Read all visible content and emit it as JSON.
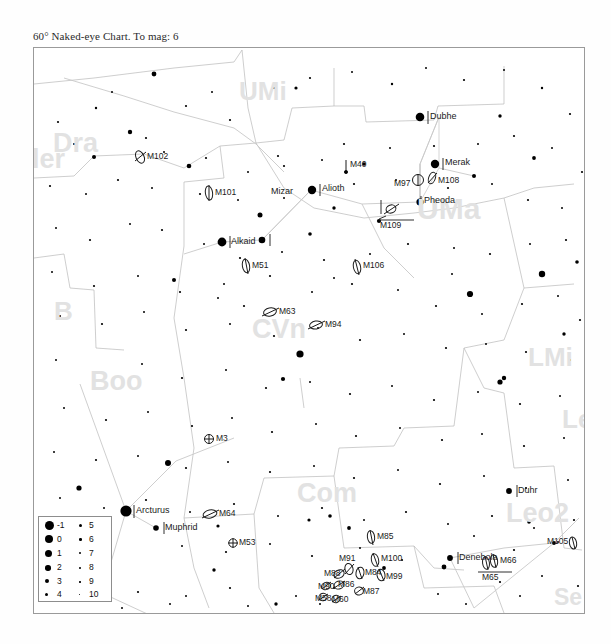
{
  "chart": {
    "title": "60° Naked-eye Chart. To mag: 6",
    "field_of_view_degrees": 60,
    "limiting_magnitude": 6,
    "frame": {
      "x": 33,
      "y": 47,
      "width": 550,
      "height": 565
    }
  },
  "legend": {
    "title": "magnitude-key",
    "rows": [
      {
        "left_mag": "-1",
        "right_mag": "5"
      },
      {
        "left_mag": "0",
        "right_mag": "6"
      },
      {
        "left_mag": "1",
        "right_mag": "7"
      },
      {
        "left_mag": "2",
        "right_mag": "8"
      },
      {
        "left_mag": "3",
        "right_mag": "9"
      },
      {
        "left_mag": "4",
        "right_mag": "10"
      }
    ]
  },
  "constellations": [
    {
      "name": "UMi",
      "x": 205,
      "y": 38,
      "size": 26
    },
    {
      "name": "Dra",
      "x": 152,
      "y": 78,
      "size": 27
    },
    {
      "name": "ler",
      "x": 36,
      "y": 152,
      "size": 27
    },
    {
      "name": "B",
      "x": 62,
      "y": 258,
      "size": 26
    },
    {
      "name": "Boo",
      "x": 90,
      "y": 378,
      "size": 27
    },
    {
      "name": "UMa",
      "x": 410,
      "y": 192,
      "size": 30
    },
    {
      "name": "CVn",
      "x": 255,
      "y": 325,
      "size": 27
    },
    {
      "name": "Com",
      "x": 300,
      "y": 492,
      "size": 27
    },
    {
      "name": "LMi",
      "x": 531,
      "y": 352,
      "size": 26
    },
    {
      "name": "Leo",
      "x": 553,
      "y": 407,
      "size": 26
    },
    {
      "name": "Leo2",
      "x": 520,
      "y": 515,
      "size": 27
    },
    {
      "name": "Se",
      "x": 557,
      "y": 593,
      "size": 23
    }
  ],
  "named_stars": [
    {
      "name": "Dubhe",
      "x": 424,
      "y": 116,
      "mag": 1.8
    },
    {
      "name": "Merak",
      "x": 438,
      "y": 163,
      "mag": 2.4
    },
    {
      "name": "Pheoda",
      "x": 419,
      "y": 201,
      "mag": 2.4
    },
    {
      "name": "Alioth",
      "x": 310,
      "y": 189,
      "mag": 1.8
    },
    {
      "name": "Mizar",
      "x": 261,
      "y": 192,
      "mag": 2.2
    },
    {
      "name": "Alkaid",
      "x": 221,
      "y": 241,
      "mag": 1.9
    },
    {
      "name": "Arcturus",
      "x": 125,
      "y": 510,
      "mag": -0.1
    },
    {
      "name": "Muphrid",
      "x": 155,
      "y": 527,
      "mag": 2.7
    },
    {
      "name": "Denebola",
      "x": 449,
      "y": 557,
      "mag": 2.1
    },
    {
      "name": "Duhr",
      "x": 508,
      "y": 490,
      "mag": 2.6
    }
  ],
  "deep_sky_objects": [
    {
      "name": "M102",
      "x": 140,
      "y": 155,
      "type": "galaxy"
    },
    {
      "name": "M101",
      "x": 209,
      "y": 191,
      "type": "galaxy"
    },
    {
      "name": "M40",
      "x": 347,
      "y": 166,
      "type": "double"
    },
    {
      "name": "M97",
      "x": 416,
      "y": 182,
      "type": "nebula"
    },
    {
      "name": "M108",
      "x": 437,
      "y": 179,
      "type": "galaxy"
    },
    {
      "name": "M109",
      "x": 391,
      "y": 213,
      "type": "galaxy"
    },
    {
      "name": "M51",
      "x": 245,
      "y": 264,
      "type": "galaxy"
    },
    {
      "name": "M106",
      "x": 357,
      "y": 265,
      "type": "galaxy"
    },
    {
      "name": "M63",
      "x": 269,
      "y": 310,
      "type": "galaxy"
    },
    {
      "name": "M94",
      "x": 313,
      "y": 323,
      "type": "galaxy"
    },
    {
      "name": "M3",
      "x": 205,
      "y": 437,
      "type": "globular"
    },
    {
      "name": "M64",
      "x": 207,
      "y": 512,
      "type": "galaxy"
    },
    {
      "name": "M53",
      "x": 232,
      "y": 541,
      "type": "globular"
    },
    {
      "name": "M85",
      "x": 371,
      "y": 535,
      "type": "galaxy"
    },
    {
      "name": "M91",
      "x": 343,
      "y": 558,
      "type": "galaxy"
    },
    {
      "name": "M100",
      "x": 374,
      "y": 558,
      "type": "galaxy"
    },
    {
      "name": "M88",
      "x": 327,
      "y": 570,
      "type": "galaxy"
    },
    {
      "name": "M84",
      "x": 352,
      "y": 570,
      "type": "galaxy"
    },
    {
      "name": "M99",
      "x": 382,
      "y": 572,
      "type": "galaxy"
    },
    {
      "name": "M90",
      "x": 322,
      "y": 583,
      "type": "galaxy"
    },
    {
      "name": "M86",
      "x": 340,
      "y": 582,
      "type": "galaxy"
    },
    {
      "name": "M87",
      "x": 358,
      "y": 589,
      "type": "galaxy"
    },
    {
      "name": "M58",
      "x": 318,
      "y": 595,
      "type": "galaxy"
    },
    {
      "name": "M60",
      "x": 336,
      "y": 597,
      "type": "galaxy"
    },
    {
      "name": "M105",
      "x": 551,
      "y": 541,
      "type": "galaxy"
    },
    {
      "name": "M66",
      "x": 497,
      "y": 560,
      "type": "galaxy"
    },
    {
      "name": "M65",
      "x": 494,
      "y": 573,
      "type": "galaxy"
    }
  ]
}
